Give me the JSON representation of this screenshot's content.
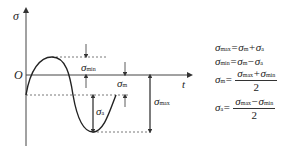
{
  "diagram": {
    "axis_y_label": "σ",
    "axis_x_label": "t",
    "origin_label": "O",
    "labels": {
      "sigma_min": {
        "base": "σ",
        "sub": "min"
      },
      "sigma_m": {
        "base": "σ",
        "sub": "m"
      },
      "sigma_a": {
        "base": "σ",
        "sub": "a"
      },
      "sigma_max": {
        "base": "σ",
        "sub": "max"
      }
    }
  },
  "formulas": {
    "f1": {
      "lhs": "σ",
      "lhs_sub": "max",
      "rhs": "=σ",
      "rhs_sub1": "m",
      "op": "+σ",
      "rhs_sub2": "a"
    },
    "f2": {
      "lhs": "σ",
      "lhs_sub": "min",
      "rhs": "=σ",
      "rhs_sub1": "m",
      "op": "−σ",
      "rhs_sub2": "a"
    },
    "f3": {
      "lhs": "σ",
      "lhs_sub": "m",
      "eq": "=",
      "num_a": "σ",
      "num_a_sub": "max",
      "num_op": "+σ",
      "num_b_sub": "min",
      "den": "2"
    },
    "f4": {
      "lhs": "σ",
      "lhs_sub": "a",
      "eq": "=",
      "num_a": "σ",
      "num_a_sub": "max",
      "num_op": "−σ",
      "num_b_sub": "min",
      "den": "2"
    }
  }
}
